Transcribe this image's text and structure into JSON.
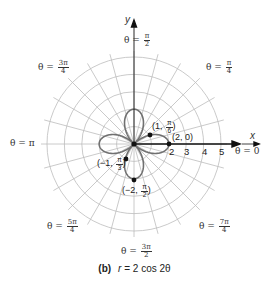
{
  "figure": {
    "caption_letter": "(b)",
    "caption_r": "r",
    "caption_rest": " = 2 cos 2θ",
    "axis_x_label": "x",
    "axis_y_label": "y",
    "theta_zero_label": "θ = 0",
    "theta_pi_label": "θ = π",
    "theta_labels": {
      "pi_over_2": {
        "prefix": "θ = ",
        "num": "π",
        "den": "2"
      },
      "pi_over_4": {
        "prefix": "θ = ",
        "num": "π",
        "den": "4"
      },
      "three_pi_over_4": {
        "prefix": "θ = ",
        "num": "3π",
        "den": "4"
      },
      "five_pi_over_4": {
        "prefix": "θ = ",
        "num": "5π",
        "den": "4"
      },
      "three_pi_over_2": {
        "prefix": "θ = ",
        "num": "3π",
        "den": "2"
      },
      "seven_pi_over_4": {
        "prefix": "θ = ",
        "num": "7π",
        "den": "4"
      }
    },
    "radial_ticks": [
      "2",
      "3",
      "4",
      "5"
    ],
    "points": [
      {
        "label_pre": "(1, ",
        "num": "π",
        "den": "6",
        "label_post": ")"
      },
      {
        "label": "(2, 0)"
      },
      {
        "label_pre": "(−1, ",
        "num": "π",
        "den": "3",
        "label_post": ")"
      },
      {
        "label_pre": "(−2, ",
        "num": "π",
        "den": "2",
        "label_post": ")"
      }
    ],
    "grid": {
      "rings": 5,
      "spoke_step_deg": 15
    },
    "colors": {
      "grid": "#b8b8b8",
      "curve": "#6e6e6e",
      "axis": "#111111"
    }
  }
}
